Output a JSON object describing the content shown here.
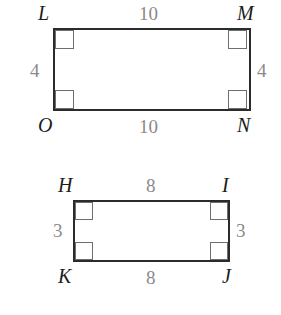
{
  "figure": {
    "stroke_color": "#2b2b2b",
    "mark_color": "#6e6e6e",
    "vertex_color": "#1c1c1c",
    "measure_color": "#8a8a8a",
    "background": "#ffffff"
  },
  "shapes": [
    {
      "name": "rectangle-LMNO",
      "vertices": {
        "top_left": "L",
        "top_right": "M",
        "bottom_left": "O",
        "bottom_right": "N"
      },
      "measures": {
        "top": "10",
        "bottom": "10",
        "left": "4",
        "right": "4"
      },
      "right_angle_marks": 4
    },
    {
      "name": "rectangle-HIJK",
      "vertices": {
        "top_left": "H",
        "top_right": "I",
        "bottom_left": "K",
        "bottom_right": "J"
      },
      "measures": {
        "top": "8",
        "bottom": "8",
        "left": "3",
        "right": "3"
      },
      "right_angle_marks": 4
    }
  ]
}
